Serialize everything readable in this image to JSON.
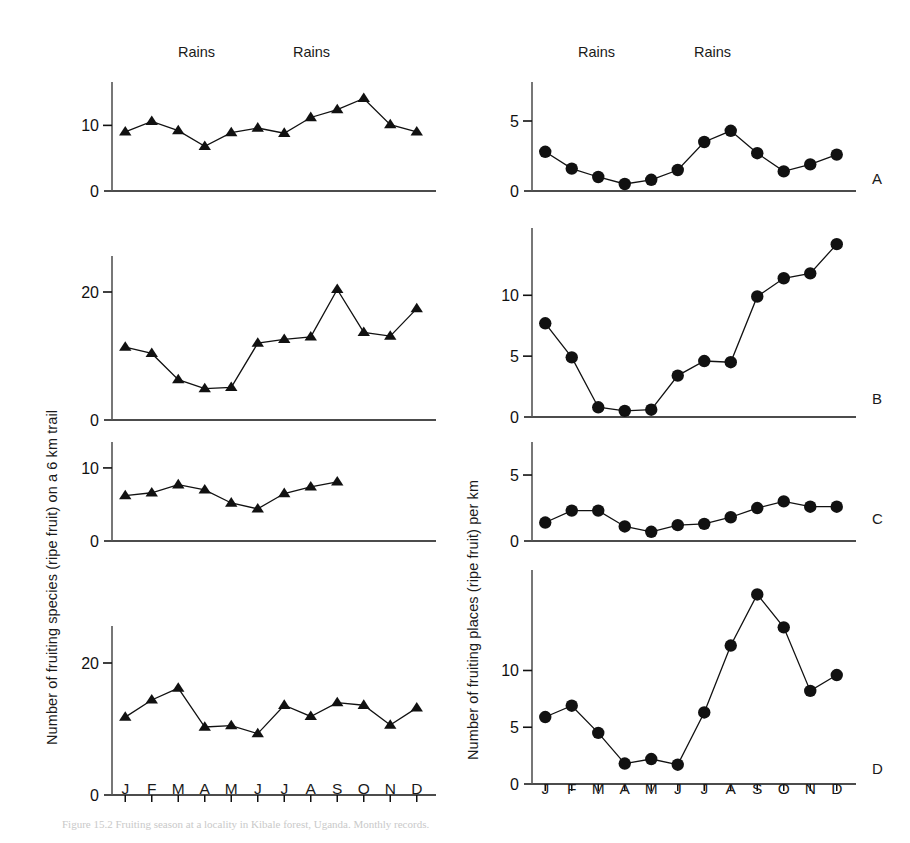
{
  "figure": {
    "ylabel_left": "Number of fruiting species (ripe fruit) on a 6 km trail",
    "ylabel_right": "Number of fruiting places (ripe fruit) per km",
    "rains_label": "Rains",
    "months": [
      "J",
      "F",
      "M",
      "A",
      "M",
      "J",
      "J",
      "A",
      "S",
      "O",
      "N",
      "D"
    ],
    "panel_letters": [
      "A",
      "B",
      "C",
      "D"
    ],
    "caption": "Figure 15.2   Fruiting season at a locality in Kibale forest, Uganda. Monthly records."
  },
  "chart_data": [
    {
      "id": "left-A",
      "type": "line",
      "panel": "A",
      "column": "left",
      "marker": "triangle",
      "title": "",
      "xlabel": "",
      "ylabel": "Number of fruiting species (ripe fruit) on a 6 km trail",
      "categories": [
        "J",
        "F",
        "M",
        "A",
        "M",
        "J",
        "J",
        "A",
        "S",
        "O",
        "N",
        "D"
      ],
      "x": [
        "J",
        "F",
        "M",
        "A",
        "M",
        "J",
        "J",
        "A",
        "S",
        "O",
        "N",
        "D"
      ],
      "values": [
        9.0,
        10.6,
        9.2,
        6.8,
        8.9,
        9.6,
        8.8,
        11.2,
        12.4,
        14.1,
        10.1,
        9.0
      ],
      "yticks": [
        0,
        10
      ],
      "ylim": [
        0,
        16
      ],
      "grid": false,
      "legend": false
    },
    {
      "id": "left-B",
      "type": "line",
      "panel": "B",
      "column": "left",
      "marker": "triangle",
      "title": "",
      "xlabel": "",
      "ylabel": "Number of fruiting species (ripe fruit) on a 6 km trail",
      "categories": [
        "J",
        "F",
        "M",
        "A",
        "M",
        "J",
        "J",
        "A",
        "S",
        "O",
        "N",
        "D"
      ],
      "x": [
        "J",
        "F",
        "M",
        "A",
        "M",
        "J",
        "J",
        "A",
        "S",
        "O",
        "N",
        "D"
      ],
      "values": [
        11.4,
        10.4,
        6.3,
        4.9,
        5.1,
        12.0,
        12.6,
        13.0,
        20.4,
        13.7,
        13.1,
        17.4
      ],
      "yticks": [
        0,
        20
      ],
      "ylim": [
        0,
        25
      ],
      "grid": false,
      "legend": false
    },
    {
      "id": "left-C",
      "type": "line",
      "panel": "C",
      "column": "left",
      "marker": "triangle",
      "title": "",
      "xlabel": "",
      "ylabel": "Number of fruiting species (ripe fruit) on a 6 km trail",
      "categories": [
        "J",
        "F",
        "M",
        "A",
        "M",
        "J",
        "J",
        "A",
        "S"
      ],
      "x": [
        "J",
        "F",
        "M",
        "A",
        "M",
        "J",
        "J",
        "A",
        "S"
      ],
      "values": [
        6.2,
        6.6,
        7.7,
        7.0,
        5.2,
        4.4,
        6.5,
        7.4,
        8.1
      ],
      "yticks": [
        0,
        10
      ],
      "ylim": [
        0,
        13
      ],
      "grid": false,
      "legend": false
    },
    {
      "id": "left-D",
      "type": "line",
      "panel": "D",
      "column": "left",
      "marker": "triangle",
      "title": "",
      "xlabel": "",
      "ylabel": "Number of fruiting species (ripe fruit) on a 6 km trail",
      "categories": [
        "J",
        "F",
        "M",
        "A",
        "M",
        "J",
        "J",
        "A",
        "S",
        "O",
        "N",
        "D"
      ],
      "x": [
        "J",
        "F",
        "M",
        "A",
        "M",
        "J",
        "J",
        "A",
        "S",
        "O",
        "N",
        "D"
      ],
      "values": [
        11.8,
        14.4,
        16.2,
        10.3,
        10.5,
        9.3,
        13.6,
        11.9,
        14.0,
        13.6,
        10.6,
        13.2
      ],
      "yticks": [
        0,
        20
      ],
      "ylim": [
        0,
        25
      ],
      "grid": false,
      "legend": false
    },
    {
      "id": "right-A",
      "type": "line",
      "panel": "A",
      "column": "right",
      "marker": "circle",
      "title": "",
      "xlabel": "",
      "ylabel": "Number of fruiting places (ripe fruit) per km",
      "categories": [
        "J",
        "F",
        "M",
        "A",
        "M",
        "J",
        "J",
        "A",
        "S",
        "O",
        "N",
        "D"
      ],
      "x": [
        "J",
        "F",
        "M",
        "A",
        "M",
        "J",
        "J",
        "A",
        "S",
        "O",
        "N",
        "D"
      ],
      "values": [
        2.8,
        1.6,
        1.0,
        0.5,
        0.8,
        1.5,
        3.5,
        4.3,
        2.7,
        1.4,
        1.9,
        2.6
      ],
      "yticks": [
        0,
        5
      ],
      "ylim": [
        0,
        7.5
      ],
      "grid": false,
      "legend": false
    },
    {
      "id": "right-B",
      "type": "line",
      "panel": "B",
      "column": "right",
      "marker": "circle",
      "title": "",
      "xlabel": "",
      "ylabel": "Number of fruiting places (ripe fruit) per km",
      "categories": [
        "J",
        "F",
        "M",
        "A",
        "M",
        "J",
        "J",
        "A",
        "S",
        "O",
        "N",
        "D"
      ],
      "x": [
        "J",
        "F",
        "M",
        "A",
        "M",
        "J",
        "J",
        "A",
        "S",
        "O",
        "N",
        "D"
      ],
      "values": [
        7.7,
        4.9,
        0.8,
        0.5,
        0.6,
        3.4,
        4.6,
        4.5,
        9.9,
        11.4,
        11.8,
        14.2
      ],
      "yticks": [
        0,
        5,
        10
      ],
      "ylim": [
        0,
        15.2
      ],
      "grid": false,
      "legend": false
    },
    {
      "id": "right-C",
      "type": "line",
      "panel": "C",
      "column": "right",
      "marker": "circle",
      "title": "",
      "xlabel": "",
      "ylabel": "Number of fruiting places (ripe fruit) per km",
      "categories": [
        "J",
        "F",
        "M",
        "A",
        "M",
        "J",
        "J",
        "A",
        "S",
        "O",
        "N",
        "D"
      ],
      "x": [
        "J",
        "F",
        "M",
        "A",
        "M",
        "J",
        "J",
        "A",
        "S",
        "O",
        "N",
        "D"
      ],
      "values": [
        1.4,
        2.3,
        2.3,
        1.1,
        0.7,
        1.2,
        1.3,
        1.8,
        2.5,
        3.0,
        2.6,
        2.6
      ],
      "yticks": [
        0,
        5
      ],
      "ylim": [
        0,
        7.2
      ],
      "grid": false,
      "legend": false
    },
    {
      "id": "right-D",
      "type": "line",
      "panel": "D",
      "column": "right",
      "marker": "circle",
      "title": "",
      "xlabel": "",
      "ylabel": "Number of fruiting places (ripe fruit) per km",
      "categories": [
        "J",
        "F",
        "M",
        "A",
        "M",
        "J",
        "J",
        "A",
        "S",
        "O",
        "N",
        "D"
      ],
      "x": [
        "J",
        "F",
        "M",
        "A",
        "M",
        "J",
        "J",
        "A",
        "S",
        "O",
        "N",
        "D"
      ],
      "values": [
        5.9,
        6.9,
        4.5,
        1.8,
        2.2,
        1.7,
        6.3,
        12.2,
        16.7,
        13.8,
        8.2,
        9.6
      ],
      "yticks": [
        0,
        5,
        10
      ],
      "ylim": [
        0,
        18.5
      ],
      "grid": false,
      "legend": false
    }
  ]
}
